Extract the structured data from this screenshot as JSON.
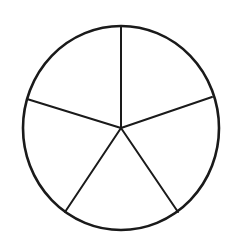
{
  "figure": {
    "kind": "geometry-diagram",
    "name": "circle-divided-into-five-sectors",
    "caption": "",
    "background_color": "#ffffff",
    "stroke_color": "#1a1a1a",
    "fill_color": "none",
    "sector_count": 5,
    "canvas": {
      "width": 232,
      "height": 248
    },
    "circle": {
      "center_x": 121,
      "center_y": 128,
      "radius_x": 98,
      "radius_y": 102,
      "stroke_width": 2.6
    },
    "dividers": [
      {
        "name": "radius-top",
        "label": "",
        "angle_deg": 90,
        "end_x": 121,
        "end_y": 26,
        "stroke_width": 2.0
      },
      {
        "name": "radius-right",
        "label": "",
        "angle_deg": 18,
        "end_x": 212,
        "end_y": 97,
        "stroke_width": 2.0
      },
      {
        "name": "radius-lower-right",
        "label": "",
        "angle_deg": -55,
        "end_x": 178,
        "end_y": 212,
        "stroke_width": 2.0
      },
      {
        "name": "radius-lower-left",
        "label": "",
        "angle_deg": -125,
        "end_x": 65,
        "end_y": 212,
        "stroke_width": 2.0
      },
      {
        "name": "radius-left",
        "label": "",
        "angle_deg": 162,
        "end_x": 27,
        "end_y": 99,
        "stroke_width": 2.0
      }
    ],
    "sectors": [
      {
        "name": "sector-top-right",
        "label": "",
        "start_angle_deg": 18,
        "end_angle_deg": 90
      },
      {
        "name": "sector-top-left",
        "label": "",
        "start_angle_deg": 90,
        "end_angle_deg": 162
      },
      {
        "name": "sector-left",
        "label": "",
        "start_angle_deg": 162,
        "end_angle_deg": 235
      },
      {
        "name": "sector-bottom",
        "label": "",
        "start_angle_deg": 235,
        "end_angle_deg": 305
      },
      {
        "name": "sector-right",
        "label": "",
        "start_angle_deg": 305,
        "end_angle_deg": 378
      }
    ]
  }
}
